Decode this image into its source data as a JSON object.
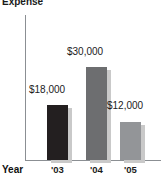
{
  "chart_data": {
    "type": "bar",
    "title": "Expense",
    "xlabel": "Year",
    "ylabel": "",
    "categories": [
      "'03",
      "'04",
      "'05"
    ],
    "values": [
      18000,
      12000,
      30000
    ],
    "series": [
      {
        "name": "Expense",
        "values": [
          18000,
          30000,
          12000
        ]
      }
    ],
    "data_labels": [
      "$18,000",
      "$30,000",
      "$12,000"
    ],
    "ylim": [
      0,
      34000
    ],
    "grid": false,
    "legend": false,
    "axis_color": "#8b8f93",
    "bar_colors": [
      "#231f20",
      "#6d6e70",
      "#939598"
    ],
    "shadow_color": "#c9c9c9"
  },
  "chart": {
    "title": "Expense",
    "x_axis_title": "Year",
    "bars": [
      {
        "category": "'03",
        "value_label": "$18,000",
        "value": 18000,
        "color": "#231f20",
        "left": 47,
        "width": 21,
        "height": 55,
        "label_left": 29,
        "label_top": 84
      },
      {
        "category": "'04",
        "value_label": "$30,000",
        "value": 30000,
        "color": "#6d6e70",
        "left": 86,
        "width": 21,
        "height": 93,
        "label_left": 67,
        "label_top": 46
      },
      {
        "category": "'05",
        "value_label": "$12,000",
        "value": 12000,
        "color": "#939598",
        "left": 120,
        "width": 21,
        "height": 38,
        "label_left": 107,
        "label_top": 100
      }
    ]
  }
}
